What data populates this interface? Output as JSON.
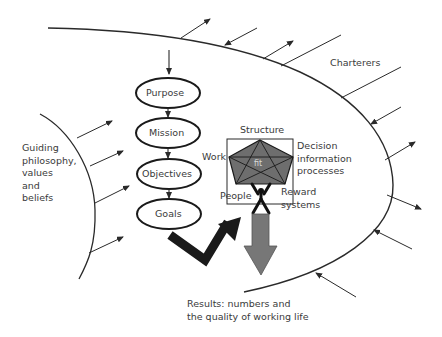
{
  "diagram": {
    "type": "conceptual-flow",
    "hierarchy": {
      "nodes": [
        "Purpose",
        "Mission",
        "Objectives",
        "Goals"
      ]
    },
    "left_influence": {
      "label": "Guiding\nphilosophy,\nvalues\nand\nbeliefs"
    },
    "boundary": {
      "label": "Charterers"
    },
    "fit_model": {
      "center_label": "fit",
      "labels": {
        "top": "Structure",
        "left": "Work",
        "right": "Decision\ninformation\nprocesses",
        "bottom_left": "People",
        "bottom_right": "Reward\nsystems"
      }
    },
    "outcome": {
      "label": "Results: numbers and\nthe quality of working life"
    },
    "colors": {
      "line": "#2a2a2a",
      "pentagon_fill": "#6e6e6e",
      "down_arrow_fill": "#777777",
      "thick_arrow": "#1a1a1a",
      "text": "#3a3a3a"
    }
  }
}
